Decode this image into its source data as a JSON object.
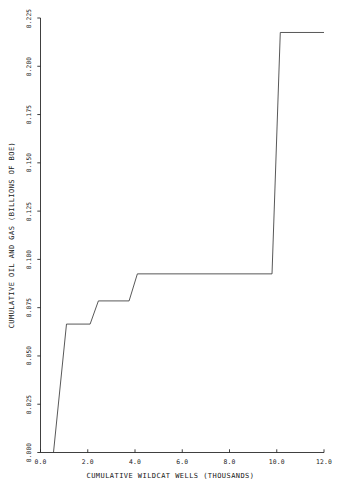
{
  "chart_data": {
    "type": "line",
    "title": "",
    "subtitle": "",
    "xlabel": "CUMULATIVE WILDCAT WELLS (THOUSANDS)",
    "ylabel": "CUMULATIVE OIL AND GAS (BILLIONS OF BOE)",
    "xlim": [
      0.0,
      12.0
    ],
    "ylim": [
      0.0,
      0.225
    ],
    "xticks": [
      "0.0",
      "2.0",
      "4.0",
      "6.0",
      "8.0",
      "10.0",
      "12.0"
    ],
    "xtick_values": [
      0.0,
      2.0,
      4.0,
      6.0,
      8.0,
      10.0,
      12.0
    ],
    "yticks": [
      "0.000",
      "0.025",
      "0.050",
      "0.075",
      "0.100",
      "0.125",
      "0.150",
      "0.175",
      "0.200",
      "0.225"
    ],
    "ytick_values": [
      0.0,
      0.025,
      0.05,
      0.075,
      0.1,
      0.125,
      0.15,
      0.175,
      0.2,
      0.225
    ],
    "grid": false,
    "legend": false,
    "legend_position": "none",
    "line_color": "#3a3a3a",
    "line_width": 0.8,
    "series": [
      {
        "name": "cumulative discovery",
        "step": true,
        "x": [
          0.55,
          1.1,
          2.1,
          2.45,
          3.75,
          4.1,
          9.8,
          10.15,
          12.0
        ],
        "y": [
          0.0,
          0.0665,
          0.0665,
          0.0785,
          0.0785,
          0.0925,
          0.0925,
          0.2175,
          0.2175
        ]
      }
    ],
    "axis_color": "#2a2a2a",
    "background": "#ffffff"
  },
  "axes": {
    "x_axis_name": "cumulative-wildcat-wells-axis",
    "y_axis_name": "cumulative-oil-and-gas-axis"
  }
}
